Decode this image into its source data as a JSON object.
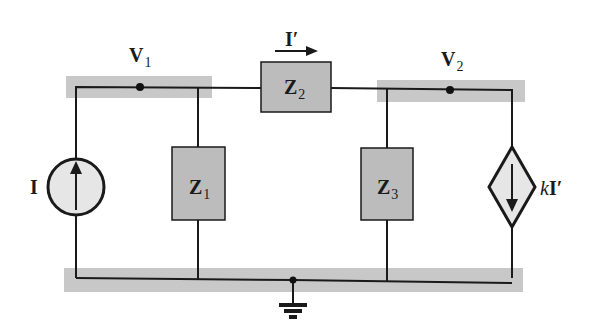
{
  "diagram": {
    "type": "circuit",
    "colors": {
      "wire": "#1a1a1a",
      "node_band": "#c8c8c8",
      "impedance_fill": "#bcbcbc",
      "source_fill": "#e6e6e6"
    },
    "nodes": {
      "v1": {
        "label": "V",
        "subscript": "1"
      },
      "v2": {
        "label": "V",
        "subscript": "2"
      },
      "ground": {
        "label": "ground"
      }
    },
    "components": {
      "current_source": {
        "label": "I",
        "direction": "up"
      },
      "z1": {
        "label": "Z",
        "subscript": "1"
      },
      "z2": {
        "label": "Z",
        "subscript": "2"
      },
      "z3": {
        "label": "Z",
        "subscript": "3"
      },
      "dependent_source": {
        "coef": "k",
        "label": "I′",
        "direction": "down"
      }
    },
    "branch_current": {
      "label": "I′",
      "direction": "right"
    }
  }
}
